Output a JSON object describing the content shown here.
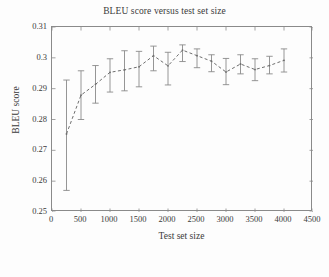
{
  "chart_data": {
    "type": "line",
    "title": "BLEU score versus test set size",
    "xlabel": "Test set size",
    "ylabel": "BLEU score",
    "xlim": [
      0,
      4500
    ],
    "ylim": [
      0.25,
      0.31
    ],
    "grid": false,
    "legend": null,
    "line_style": "dashed",
    "error_bars": true,
    "xticks": [
      0,
      500,
      1000,
      1500,
      2000,
      2500,
      3000,
      3500,
      4000,
      4500
    ],
    "xtick_labels": [
      "0",
      "500",
      "1000",
      "1500",
      "2000",
      "2500",
      "3000",
      "3500",
      "4000",
      "4500"
    ],
    "yticks": [
      0.25,
      0.26,
      0.27,
      0.28,
      0.29,
      0.3,
      0.31
    ],
    "ytick_labels": [
      "0.25",
      "0.26",
      "0.27",
      "0.28",
      "0.29",
      "0.3",
      "0.31"
    ],
    "x": [
      250,
      500,
      750,
      1000,
      1250,
      1500,
      1750,
      2000,
      2250,
      2500,
      2750,
      3000,
      3250,
      3500,
      3750,
      4000
    ],
    "values": [
      0.2753,
      0.2879,
      0.2914,
      0.2953,
      0.2961,
      0.2971,
      0.3007,
      0.2974,
      0.3025,
      0.3007,
      0.2989,
      0.2954,
      0.298,
      0.2962,
      0.2975,
      0.2992
    ],
    "err_low": [
      0.257,
      0.28,
      0.2853,
      0.2889,
      0.2893,
      0.2906,
      0.2958,
      0.2912,
      0.2988,
      0.2968,
      0.2955,
      0.2913,
      0.2948,
      0.2926,
      0.2948,
      0.2954
    ],
    "err_high": [
      0.2928,
      0.2958,
      0.2975,
      0.2997,
      0.3023,
      0.3021,
      0.3038,
      0.3018,
      0.3042,
      0.3029,
      0.301,
      0.2998,
      0.301,
      0.2997,
      0.3005,
      0.3029
    ],
    "colors": {
      "line": "#6e6e6e",
      "error_bar": "#8a8a8a",
      "axis": "#8a8a8a",
      "text": "#3a3a3a",
      "background": "#fdfdfd"
    }
  }
}
